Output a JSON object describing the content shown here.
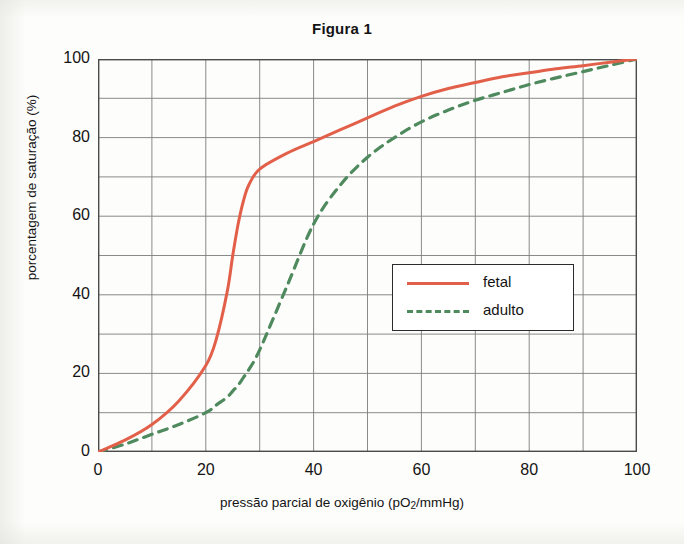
{
  "chart_data": {
    "type": "line",
    "title": "Figura 1",
    "xlabel": "pressão parcial de oxigênio (pO2/mmHg)",
    "xlabel_prefix": "pressão parcial de oxigênio (pO",
    "xlabel_sub": "2",
    "xlabel_suffix": "/mmHg)",
    "ylabel": "porcentagem de saturação (%)",
    "xlim": [
      0,
      100
    ],
    "ylim": [
      0,
      100
    ],
    "xticks": [
      "0",
      "20",
      "40",
      "60",
      "80",
      "100"
    ],
    "xtick_values": [
      0,
      20,
      40,
      60,
      80,
      100
    ],
    "yticks": [
      "0",
      "20",
      "40",
      "60",
      "80",
      "100"
    ],
    "ytick_values": [
      0,
      20,
      40,
      60,
      80,
      100
    ],
    "grid": true,
    "grid_step_x": 10,
    "grid_step_y": 10,
    "grid_color": "#7d7d7d",
    "frame_color": "#4a4a4a",
    "legend_position": "center-right",
    "x": [
      0,
      5,
      10,
      15,
      20,
      22,
      24,
      25,
      26,
      27,
      28,
      30,
      35,
      40,
      45,
      50,
      55,
      60,
      65,
      70,
      75,
      80,
      85,
      90,
      95,
      100
    ],
    "series": [
      {
        "name": "fetal",
        "label": "fetal",
        "color": "#e2604a",
        "style": "solid",
        "values": [
          0,
          3,
          7,
          13,
          22,
          29,
          41,
          50,
          58,
          64,
          68,
          72,
          76,
          79,
          82,
          85,
          88,
          90.5,
          92.5,
          94,
          95.5,
          96.5,
          97.5,
          98.3,
          99.2,
          100
        ]
      },
      {
        "name": "adulto",
        "label": "adulto",
        "color": "#4f8a5e",
        "style": "dashed",
        "values": [
          0,
          2,
          4.5,
          7,
          10,
          12,
          14,
          15.5,
          17,
          19,
          21,
          26,
          42,
          58,
          68,
          75,
          80,
          84,
          87,
          89.5,
          91.5,
          93.5,
          95.2,
          96.8,
          98.4,
          100
        ]
      }
    ]
  },
  "legend": {
    "entries": [
      {
        "label": "fetal"
      },
      {
        "label": "adulto"
      }
    ]
  }
}
